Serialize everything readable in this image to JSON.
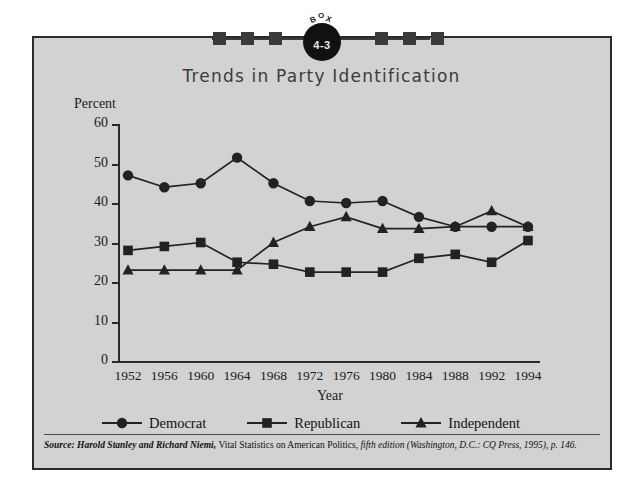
{
  "badge": {
    "word": "BOX",
    "number": "4-3",
    "square_count": 6
  },
  "title": "Trends in Party Identification",
  "source": {
    "prefix": "Source:",
    "authors": "Harold Stanley and Richard Niemi,",
    "work": "Vital Statistics on American Politics,",
    "edition": "fifth edition (Washington, D.C.: CQ Press, 1995), p. 146."
  },
  "chart_data": {
    "type": "line",
    "title": "Trends in Party Identification",
    "xlabel": "Year",
    "ylabel": "Percent",
    "ylim": [
      0,
      60
    ],
    "yticks": [
      0,
      10,
      20,
      30,
      40,
      50,
      60
    ],
    "grid": false,
    "legend_position": "bottom",
    "categories": [
      "1952",
      "1956",
      "1960",
      "1964",
      "1968",
      "1972",
      "1976",
      "1980",
      "1984",
      "1988",
      "1992",
      "1994"
    ],
    "series": [
      {
        "name": "Democrat",
        "marker": "circle",
        "color": "#222222",
        "values": [
          47,
          44,
          45,
          51.5,
          45,
          40.5,
          40,
          40.5,
          36.5,
          34,
          34,
          34
        ]
      },
      {
        "name": "Republican",
        "marker": "square",
        "color": "#222222",
        "values": [
          28,
          29,
          30,
          25,
          24.5,
          22.5,
          22.5,
          22.5,
          26,
          27,
          25,
          30.5
        ]
      },
      {
        "name": "Independent",
        "marker": "triangle",
        "color": "#222222",
        "values": [
          23,
          23,
          23,
          23,
          30,
          34,
          36.5,
          33.5,
          33.5,
          34,
          38,
          34
        ]
      }
    ]
  },
  "colors": {
    "panel_background": "#d2d2d2",
    "frame": "#2b2b2b",
    "ink": "#1a1a1a",
    "title": "#3b3b3b"
  }
}
